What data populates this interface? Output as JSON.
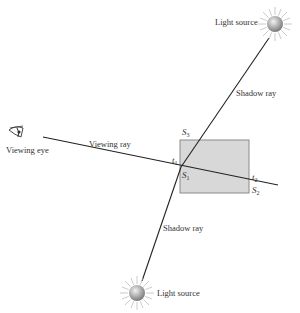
{
  "diagram": {
    "colors": {
      "line": "#222222",
      "object_fill": "#d8d8d8",
      "object_stroke": "#8a8a8a",
      "text": "#333333",
      "sun_core": "#9a9a9a",
      "sun_rays": "#b5b5b5"
    },
    "labels": {
      "light_source_top": "Light source",
      "light_source_bottom": "Light source",
      "shadow_ray_top": "Shadow ray",
      "shadow_ray_bottom": "Shadow ray",
      "viewing_ray": "Viewing ray",
      "viewing_eye": "Viewing eye"
    },
    "symbols": {
      "s3": {
        "base": "S",
        "sub": "3"
      },
      "t1": {
        "base": "t",
        "sub": "1"
      },
      "s1": {
        "base": "S",
        "sub": "1"
      },
      "t2": {
        "base": "t",
        "sub": "2"
      },
      "s2": {
        "base": "S",
        "sub": "2"
      }
    },
    "icons": {
      "eye": "eye-icon",
      "light_top": "sun-icon",
      "light_bottom": "sun-icon"
    }
  }
}
